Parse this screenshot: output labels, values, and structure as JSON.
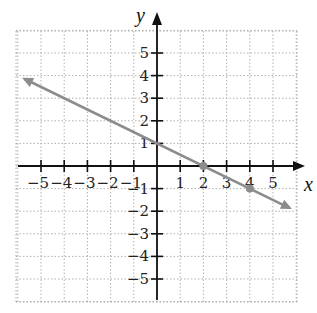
{
  "chart_data": {
    "type": "line",
    "title": "",
    "xlabel": "x",
    "ylabel": "y",
    "xlim": [
      -6,
      6
    ],
    "ylim": [
      -6,
      6
    ],
    "grid": true,
    "x_ticks": [
      -5,
      -4,
      -3,
      -2,
      -1,
      1,
      2,
      3,
      4,
      5
    ],
    "y_ticks": [
      -5,
      -4,
      -3,
      -2,
      -1,
      1,
      2,
      3,
      4,
      5
    ],
    "x_tick_labels": [
      "−5",
      "−4",
      "−3",
      "−2",
      "−1",
      "1",
      "2",
      "3",
      "4",
      "5"
    ],
    "y_tick_labels": [
      "−5",
      "−4",
      "−3",
      "−2",
      "−1",
      "1",
      "2",
      "3",
      "4",
      "5"
    ],
    "series": [
      {
        "name": "line",
        "equation": "y = -0.5x + 1",
        "slope": -0.5,
        "intercept": 1,
        "x": [
          -5.7,
          5.7
        ],
        "y": [
          3.85,
          -1.85
        ],
        "arrows": "both",
        "color": "#8c8c8c"
      }
    ],
    "points": [
      {
        "x": 0,
        "y": 1,
        "marked": false
      },
      {
        "x": 2,
        "y": 0,
        "marked": true
      },
      {
        "x": 4,
        "y": -1,
        "marked": true
      }
    ]
  },
  "labels": {
    "x_axis": "x",
    "y_axis": "y"
  },
  "colors": {
    "axis": "#111111",
    "grid": "#b0b0b0",
    "line": "#8c8c8c",
    "point": "#8c8c8c"
  }
}
